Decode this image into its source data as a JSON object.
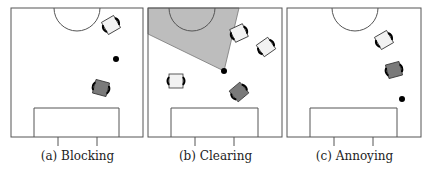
{
  "panels": [
    {
      "id": "a",
      "caption": "(a) Blocking",
      "x": 11,
      "ball": {
        "x": 116,
        "y": 59
      },
      "robots": [
        {
          "x": 111,
          "y": 25,
          "angle": -30,
          "shade": "light"
        },
        {
          "x": 101,
          "y": 88,
          "angle": 15,
          "shade": "dark"
        }
      ],
      "shaded_region": null
    },
    {
      "id": "b",
      "caption": "(b) Clearing",
      "x": 148,
      "ball": {
        "x": 224,
        "y": 71
      },
      "robots": [
        {
          "x": 239,
          "y": 33,
          "angle": -25,
          "shade": "light"
        },
        {
          "x": 266,
          "y": 47,
          "angle": -35,
          "shade": "light"
        },
        {
          "x": 176,
          "y": 81,
          "angle": 0,
          "shade": "light"
        },
        {
          "x": 239,
          "y": 92,
          "angle": -40,
          "shade": "dark"
        }
      ],
      "shaded_region": "148,8 148,34 224,71 239,8"
    },
    {
      "id": "c",
      "caption": "(c) Annoying",
      "x": 287,
      "ball": {
        "x": 402,
        "y": 99
      },
      "robots": [
        {
          "x": 384,
          "y": 40,
          "angle": -30,
          "shade": "light"
        },
        {
          "x": 394,
          "y": 70,
          "angle": -15,
          "shade": "dark"
        }
      ],
      "shaded_region": null
    }
  ],
  "colors": {
    "line": "#555555",
    "light_robot": "#f2f2f2",
    "dark_robot": "#7a7a7a",
    "shade": "#bdbdbd",
    "ball": "#000000"
  }
}
